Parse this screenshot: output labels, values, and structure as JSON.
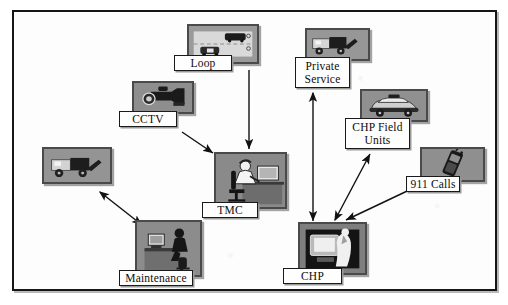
{
  "diagram": {
    "background_color": "#fdfdfd",
    "border_color": "#151515",
    "tile_color": "#8e8e8e",
    "line_color": "#111111",
    "nodes": [
      {
        "id": "loop",
        "label": "Loop",
        "icon": "road-loop-detector-icon",
        "lines": [
          "Loop"
        ]
      },
      {
        "id": "cctv",
        "label": "CCTV",
        "icon": "video-camera-icon",
        "lines": [
          "CCTV"
        ]
      },
      {
        "id": "tow",
        "label": "",
        "icon": "tow-truck-icon",
        "lines": []
      },
      {
        "id": "maintenance",
        "label": "Maintenance",
        "icon": "desk-worker-icon",
        "lines": [
          "Maintenance"
        ]
      },
      {
        "id": "tmc",
        "label": "TMC",
        "icon": "operator-workstation-icon",
        "lines": [
          "TMC"
        ]
      },
      {
        "id": "private",
        "label": "Private Service",
        "icon": "tow-truck-icon",
        "lines": [
          "Private",
          "Service"
        ]
      },
      {
        "id": "chp-field",
        "label": "CHP Field Units",
        "icon": "patrol-car-icon",
        "lines": [
          "CHP Field",
          "Units"
        ]
      },
      {
        "id": "calls",
        "label": "911 Calls",
        "icon": "mobile-phone-icon",
        "lines": [
          "911 Calls"
        ]
      },
      {
        "id": "chp",
        "label": "CHP",
        "icon": "dispatcher-monitor-icon",
        "lines": [
          "CHP"
        ]
      }
    ],
    "links": [
      {
        "from": "loop",
        "to": "tmc",
        "arrow": "single"
      },
      {
        "from": "cctv",
        "to": "tmc",
        "arrow": "single"
      },
      {
        "from": "tow",
        "to": "maintenance",
        "arrow": "double"
      },
      {
        "from": "chp",
        "to": "private",
        "arrow": "double"
      },
      {
        "from": "chp",
        "to": "chp-field",
        "arrow": "double"
      },
      {
        "from": "calls",
        "to": "chp",
        "arrow": "single"
      },
      {
        "from": "tmc",
        "to": "chp",
        "arrow": "single"
      }
    ]
  }
}
